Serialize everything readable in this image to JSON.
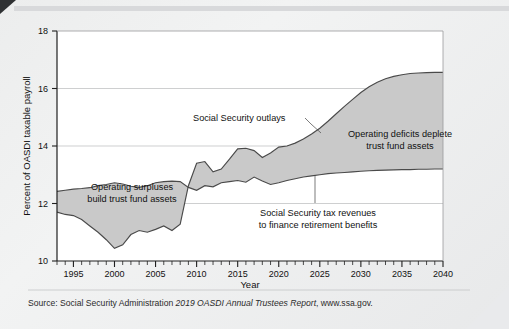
{
  "chart_data": {
    "type": "area",
    "title": "",
    "subtitle": "",
    "xlabel": "Year",
    "ylabel": "Percent of OASDI taxable payroll",
    "xlim": [
      1993,
      2040
    ],
    "ylim": [
      10,
      18
    ],
    "yticks": [
      10,
      12,
      14,
      16,
      18
    ],
    "xticks": [
      1995,
      2000,
      2005,
      2010,
      2015,
      2020,
      2025,
      2030,
      2035,
      2040
    ],
    "xtick_labels": [
      "1995",
      "2000",
      "2005",
      "2010",
      "2015",
      "2020",
      "2025",
      "2030",
      "2035",
      "2040"
    ],
    "ytick_labels": [
      "10",
      "12",
      "14",
      "16",
      "18"
    ],
    "minor_xtick_step": 1,
    "grid": "horizontal",
    "legend": "none",
    "x": [
      1993,
      1994,
      1995,
      1996,
      1997,
      1998,
      1999,
      2000,
      2001,
      2002,
      2003,
      2004,
      2005,
      2006,
      2007,
      2008,
      2009,
      2010,
      2011,
      2012,
      2013,
      2014,
      2015,
      2016,
      2017,
      2018,
      2019,
      2020,
      2021,
      2022,
      2023,
      2024,
      2025,
      2026,
      2027,
      2028,
      2029,
      2030,
      2031,
      2032,
      2033,
      2034,
      2035,
      2036,
      2037,
      2038,
      2039,
      2040
    ],
    "series": [
      {
        "name": "Social Security tax revenues to finance retirement benefits",
        "role": "revenues",
        "values": [
          12.42,
          12.46,
          12.5,
          12.52,
          12.55,
          12.62,
          12.66,
          12.72,
          12.68,
          12.6,
          12.56,
          12.62,
          12.72,
          12.76,
          12.78,
          12.76,
          12.56,
          12.46,
          12.62,
          12.58,
          12.72,
          12.76,
          12.8,
          12.74,
          12.92,
          12.78,
          12.66,
          12.72,
          12.8,
          12.86,
          12.92,
          12.96,
          13.0,
          13.04,
          13.06,
          13.08,
          13.1,
          13.12,
          13.14,
          13.15,
          13.16,
          13.17,
          13.18,
          13.18,
          13.19,
          13.19,
          13.2,
          13.2
        ]
      },
      {
        "name": "Social Security outlays",
        "role": "outlays",
        "values": [
          11.7,
          11.62,
          11.58,
          11.44,
          11.22,
          11.0,
          10.74,
          10.44,
          10.56,
          10.92,
          11.06,
          11.0,
          11.1,
          11.22,
          11.06,
          11.28,
          12.62,
          13.4,
          13.46,
          13.1,
          13.2,
          13.54,
          13.9,
          13.92,
          13.84,
          13.6,
          13.76,
          13.96,
          14.0,
          14.1,
          14.24,
          14.42,
          14.62,
          14.86,
          15.12,
          15.38,
          15.62,
          15.86,
          16.06,
          16.22,
          16.34,
          16.42,
          16.48,
          16.52,
          16.54,
          16.55,
          16.56,
          16.56
        ]
      }
    ],
    "fill_color": "#c9c9c9",
    "line_color": "#4a4a4a",
    "annotations": [
      {
        "id": "outlays-label",
        "text": "Social Security outlays",
        "lines": [
          "Social Security outlays"
        ]
      },
      {
        "id": "surplus-label",
        "text": "Operating surpluses build trust fund assets",
        "lines": [
          "Operating surpluses",
          "build trust fund assets"
        ]
      },
      {
        "id": "deficit-label",
        "text": "Operating deficits deplete trust fund assets",
        "lines": [
          "Operating deficits deplete",
          "trust fund assets"
        ]
      },
      {
        "id": "revenues-label",
        "text": "Social Security tax revenues to finance retirement benefits",
        "lines": [
          "Social Security tax revenues",
          "to finance retirement benefits"
        ]
      }
    ]
  },
  "source": {
    "prefix": "Source: Social Security Administration ",
    "emphasis": "2019 OASDI Annual Trustees Report",
    "suffix": ", www.ssa.gov."
  }
}
